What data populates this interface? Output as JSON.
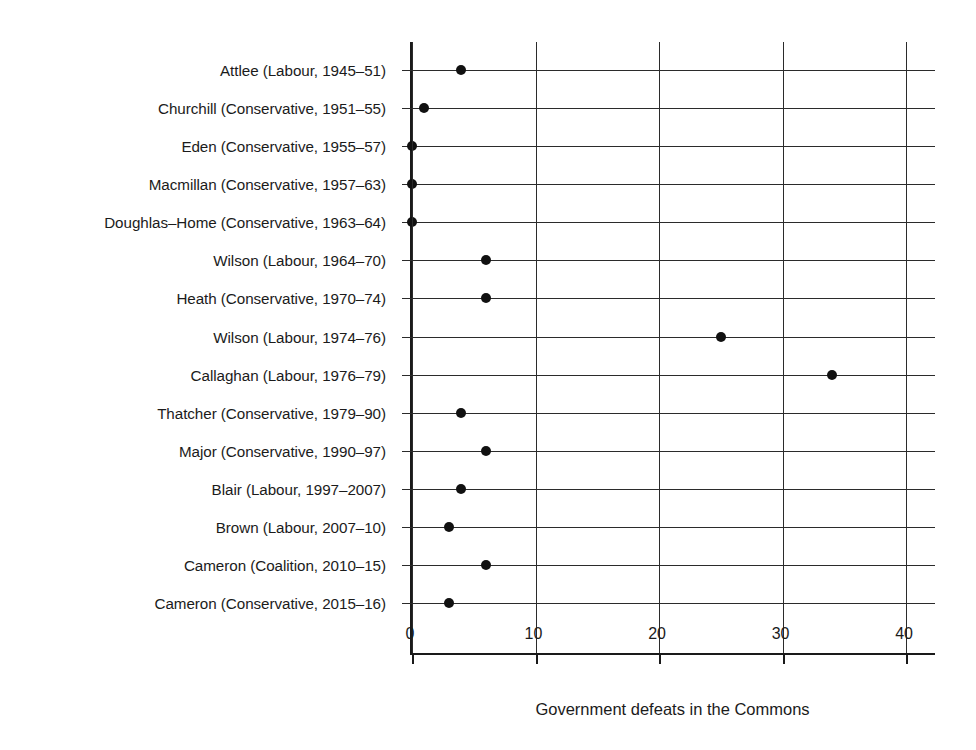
{
  "chart_data": {
    "type": "scatter",
    "title": "",
    "xlabel": "Government defeats in the Commons",
    "ylabel": "Prime Minister",
    "xlim": [
      0,
      42.5
    ],
    "xticks": [
      0,
      10,
      20,
      30,
      40
    ],
    "xticklabels": [
      "0",
      "10",
      "20",
      "30",
      "40"
    ],
    "grid": "both",
    "legend": "none",
    "marker": "filled-circle",
    "marker_color": "#111111",
    "categories": [
      "Attlee (Labour, 1945–51)",
      "Churchill (Conservative, 1951–55)",
      "Eden (Conservative, 1955–57)",
      "Macmillan (Conservative, 1957–63)",
      "Doughlas–Home (Conservative, 1963–64)",
      "Wilson (Labour, 1964–70)",
      "Heath (Conservative, 1970–74)",
      "Wilson (Labour, 1974–76)",
      "Callaghan (Labour, 1976–79)",
      "Thatcher (Conservative, 1979–90)",
      "Major (Conservative, 1990–97)",
      "Blair (Labour, 1997–2007)",
      "Brown (Labour, 2007–10)",
      "Cameron (Coalition, 2010–15)",
      "Cameron (Conservative, 2015–16)"
    ],
    "values": [
      4,
      1,
      0,
      0,
      0,
      6,
      6,
      25,
      34,
      4,
      6,
      4,
      3,
      6,
      3
    ]
  }
}
